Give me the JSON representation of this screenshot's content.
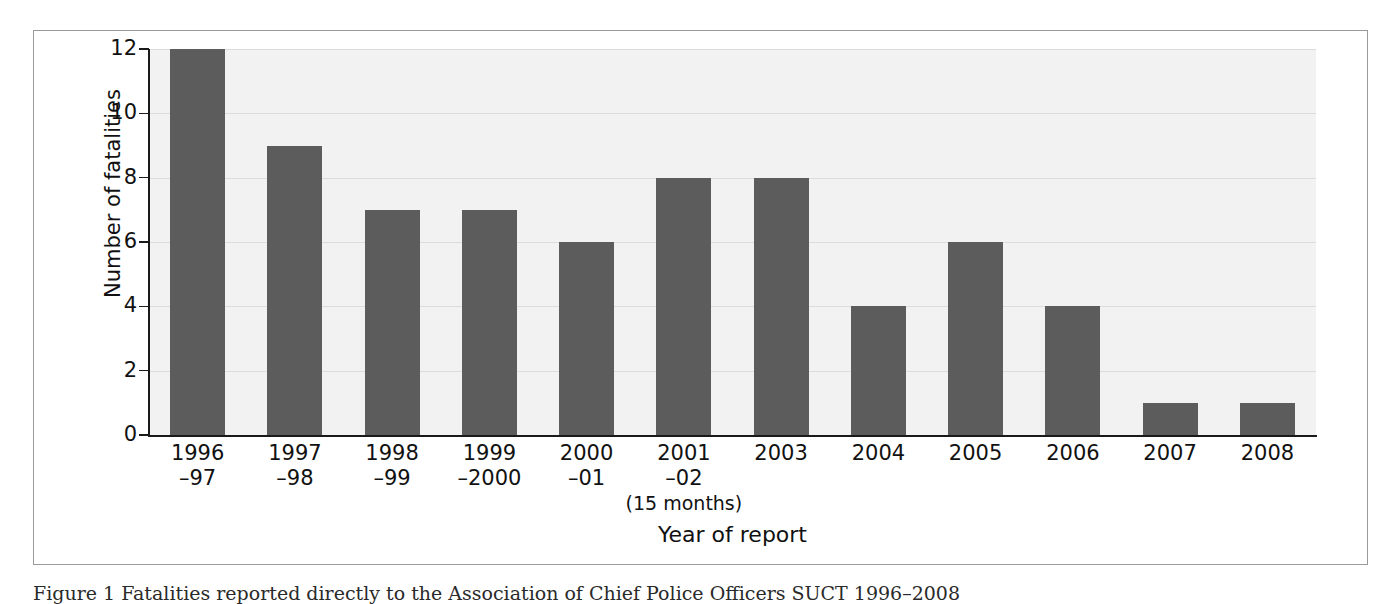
{
  "figure": {
    "caption": "Figure 1  Fatalities reported directly to the Association of Chief Police Officers SUCT 1996–2008"
  },
  "chart_data": {
    "type": "bar",
    "title": "",
    "xlabel": "Year of report",
    "ylabel": "Number of fatalities",
    "categories": [
      "1996–97",
      "1997–98",
      "1998–99",
      "1999–2000",
      "2000–01",
      "2001–02 (15 months)",
      "2003",
      "2004",
      "2005",
      "2006",
      "2007",
      "2008"
    ],
    "category_lines": [
      {
        "line1": "1996",
        "line2": "–97",
        "line3": ""
      },
      {
        "line1": "1997",
        "line2": "–98",
        "line3": ""
      },
      {
        "line1": "1998",
        "line2": "–99",
        "line3": ""
      },
      {
        "line1": "1999",
        "line2": "–2000",
        "line3": ""
      },
      {
        "line1": "2000",
        "line2": "–01",
        "line3": ""
      },
      {
        "line1": "2001",
        "line2": "–02",
        "line3": "(15 months)"
      },
      {
        "line1": "2003",
        "line2": "",
        "line3": ""
      },
      {
        "line1": "2004",
        "line2": "",
        "line3": ""
      },
      {
        "line1": "2005",
        "line2": "",
        "line3": ""
      },
      {
        "line1": "2006",
        "line2": "",
        "line3": ""
      },
      {
        "line1": "2007",
        "line2": "",
        "line3": ""
      },
      {
        "line1": "2008",
        "line2": "",
        "line3": ""
      }
    ],
    "values": [
      12,
      9,
      7,
      7,
      6,
      8,
      8,
      4,
      6,
      4,
      1,
      1
    ],
    "ylim": [
      0,
      12
    ],
    "yticks": [
      0,
      2,
      4,
      6,
      8,
      10,
      12
    ],
    "ytick_labels": [
      "0",
      "2",
      "4",
      "6",
      "8",
      "10",
      "12"
    ],
    "grid": true,
    "legend": "none",
    "colors": {
      "bar": "#5c5c5c",
      "plot_background": "#f2f2f2",
      "gridline": "#dcdcdc",
      "axis": "#1a1a1a",
      "frame": "#9a9a9a",
      "text": "#111111"
    }
  }
}
